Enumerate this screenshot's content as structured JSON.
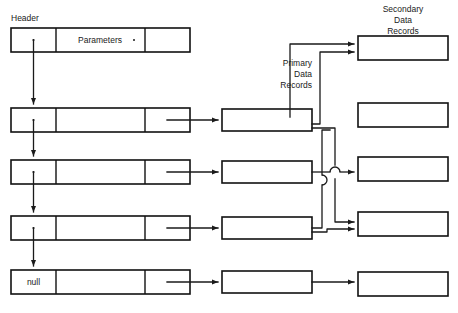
{
  "diagram": {
    "title_labels": {
      "header": "Header",
      "primary": "Primary\nData\nRecords",
      "primary_line1": "Primary",
      "primary_line2": "Data",
      "primary_line3": "Records",
      "secondary_line1": "Secondary",
      "secondary_line2": "Data",
      "secondary_line3": "Records"
    },
    "colors": {
      "background": "#ffffff",
      "stroke": "#111111",
      "text": "#1a1a1a"
    },
    "header_row": {
      "name": "header-node",
      "cells": [
        {
          "label": "",
          "marker": "dot"
        },
        {
          "label": "Parameters",
          "marker": "dot"
        },
        {
          "label": "",
          "marker": "none"
        }
      ]
    },
    "list_nodes": [
      {
        "name": "list-node-1",
        "pointer_label": "",
        "marker": "dot"
      },
      {
        "name": "list-node-2",
        "pointer_label": "",
        "marker": "dot"
      },
      {
        "name": "list-node-3",
        "pointer_label": "",
        "marker": "dot"
      },
      {
        "name": "list-node-4",
        "pointer_label": "null",
        "marker": "none"
      }
    ],
    "primary_records": [
      {
        "name": "primary-record-1",
        "label": ""
      },
      {
        "name": "primary-record-2",
        "label": ""
      },
      {
        "name": "primary-record-3",
        "label": ""
      },
      {
        "name": "primary-record-4",
        "label": ""
      }
    ],
    "secondary_records": [
      {
        "name": "secondary-record-1",
        "label": ""
      },
      {
        "name": "secondary-record-2",
        "label": ""
      },
      {
        "name": "secondary-record-3",
        "label": ""
      },
      {
        "name": "secondary-record-4",
        "label": ""
      },
      {
        "name": "secondary-record-5",
        "label": ""
      }
    ]
  }
}
